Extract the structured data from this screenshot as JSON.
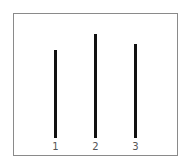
{
  "chart_data": {
    "type": "bar",
    "title": "",
    "xlabel": "",
    "ylabel": "",
    "categories": [
      "1",
      "2",
      "3"
    ],
    "values": [
      88,
      104,
      94
    ],
    "grid": false,
    "legend": null,
    "style": "vertical line segments, common baseline"
  },
  "figure": {
    "lines": [
      {
        "label": "1",
        "x": 55,
        "top": 50,
        "bottom": 138
      },
      {
        "label": "2",
        "x": 95,
        "top": 34,
        "bottom": 138
      },
      {
        "label": "3",
        "x": 135,
        "top": 44,
        "bottom": 138
      }
    ],
    "line_color": "#111111",
    "frame_color": "#8a8a8a"
  }
}
